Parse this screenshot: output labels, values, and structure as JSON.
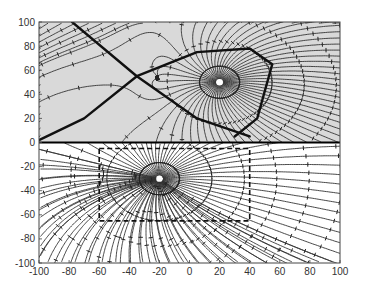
{
  "chart_data": {
    "type": "streamline",
    "title": "",
    "xlabel": "",
    "ylabel": "",
    "xlim": [
      -100,
      100
    ],
    "ylim": [
      -100,
      100
    ],
    "x_ticks": [
      -100,
      -80,
      -60,
      -40,
      -20,
      0,
      20,
      40,
      60,
      80,
      100
    ],
    "y_ticks": [
      -100,
      -80,
      -60,
      -40,
      -20,
      0,
      20,
      40,
      60,
      80,
      100
    ],
    "x_tick_labels": [
      "-100",
      "-80",
      "-60",
      "-40",
      "-20",
      "0",
      "20",
      "40",
      "60",
      "80",
      "100"
    ],
    "y_tick_labels": [
      "-100",
      "-80",
      "-60",
      "-40",
      "-20",
      "0",
      "20",
      "40",
      "60",
      "80",
      "100"
    ],
    "grid": false,
    "legend": null,
    "regions": [
      {
        "name": "upper half-plane",
        "y_range": [
          0,
          100
        ],
        "background": "#d9d9d9"
      },
      {
        "name": "lower half-plane",
        "y_range": [
          -100,
          0
        ],
        "background": "#ffffff"
      }
    ],
    "critical_points": [
      {
        "type": "node (radial)",
        "x": 20,
        "y": 50
      },
      {
        "type": "saddle",
        "x": -35,
        "y": 55
      },
      {
        "type": "node (radial)",
        "x": -20,
        "y": -30
      }
    ],
    "separatrices": [
      {
        "description": "diagonal separatrix from upper-left corner through saddle",
        "points": [
          [
            -78,
            100
          ],
          [
            -35,
            55
          ],
          [
            5,
            20
          ],
          [
            40,
            5
          ]
        ]
      },
      {
        "description": "curved separatrix from origin-left rising through saddle to top-right loop",
        "points": [
          [
            -100,
            2
          ],
          [
            -70,
            20
          ],
          [
            -35,
            55
          ],
          [
            5,
            75
          ],
          [
            40,
            78
          ],
          [
            55,
            65
          ],
          [
            45,
            20
          ],
          [
            30,
            5
          ]
        ]
      }
    ],
    "boundaries": [
      {
        "description": "dashed rectangular boundary around lower node",
        "x_range": [
          -60,
          40
        ],
        "y_range": [
          -65,
          -5
        ]
      }
    ],
    "axis_line": {
      "y": 0,
      "color": "#000000"
    },
    "line_color": "#333333"
  }
}
